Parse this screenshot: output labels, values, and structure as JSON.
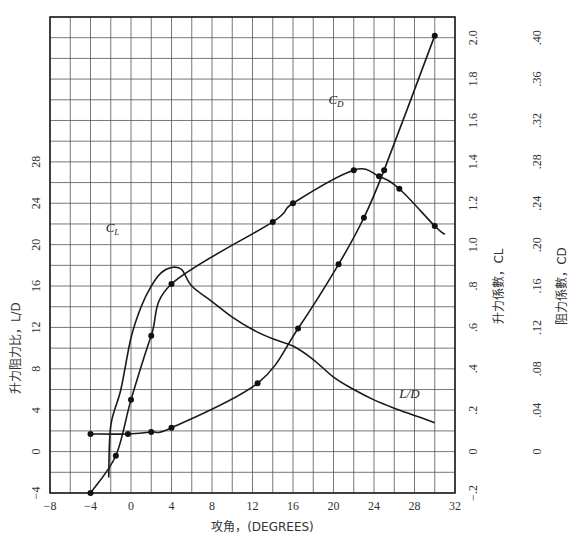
{
  "chart_data": {
    "type": "line",
    "title": "",
    "xlabel": "攻角，(DEGREES)",
    "xlim": [
      -8,
      32
    ],
    "x_ticks": [
      -8,
      -4,
      0,
      4,
      8,
      12,
      16,
      20,
      24,
      28,
      32
    ],
    "grid": true,
    "axes": {
      "left": {
        "label": "升力阻力比，L/D",
        "ticks": [
          -4,
          0,
          4,
          8,
          12,
          16,
          20,
          24,
          28
        ],
        "range": [
          -4,
          42
        ]
      },
      "right1": {
        "label": "升力係數，C_L",
        "ticks": [
          -0.2,
          0,
          0.2,
          0.4,
          0.6,
          0.8,
          1.0,
          1.2,
          1.4,
          1.6,
          1.8,
          2.0
        ],
        "tick_labels": [
          "−.2",
          "0",
          ".2",
          ".4",
          ".6",
          ".8",
          "1.0",
          "1.2",
          "1.4",
          "1.6",
          "1.8",
          "2.0"
        ],
        "range": [
          -0.2,
          2.1
        ]
      },
      "right2": {
        "label": "阻力係數，C_D",
        "ticks": [
          0,
          0.04,
          0.08,
          0.12,
          0.16,
          0.2,
          0.24,
          0.28,
          0.32,
          0.36,
          0.4
        ],
        "tick_labels": [
          "0",
          ".04",
          ".08",
          ".12",
          ".16",
          ".20",
          ".24",
          ".28",
          ".32",
          ".36",
          ".40"
        ],
        "range": [
          -0.04,
          0.42
        ]
      }
    },
    "series": [
      {
        "name": "C_L",
        "axis": "right1",
        "label": "C",
        "label_sub": "L",
        "x": [
          -4,
          -1.5,
          0,
          2,
          4,
          14,
          16,
          22,
          24.5,
          26.5,
          30
        ],
        "values": [
          -0.2,
          -0.02,
          0.25,
          0.56,
          0.81,
          1.11,
          1.2,
          1.36,
          1.33,
          1.27,
          1.09
        ],
        "markers": true
      },
      {
        "name": "C_D",
        "axis": "right2",
        "label": "C",
        "label_sub": "D",
        "x": [
          -4,
          -0.3,
          2,
          4,
          12.5,
          16.5,
          20.5,
          23,
          25,
          30
        ],
        "values": [
          0.017,
          0.017,
          0.019,
          0.023,
          0.066,
          0.119,
          0.181,
          0.226,
          0.272,
          0.402
        ],
        "markers": true
      },
      {
        "name": "L/D",
        "axis": "left",
        "label": "L/D",
        "x": [
          -2.2,
          -2,
          -1,
          0,
          1,
          2,
          3,
          4,
          5,
          6,
          8,
          10,
          12,
          14,
          16,
          18,
          20,
          22,
          24,
          26,
          28,
          30
        ],
        "values": [
          -2.5,
          2.5,
          6,
          11,
          14,
          16,
          17.3,
          17.8,
          17.6,
          16,
          14.5,
          13,
          11.8,
          10.9,
          10.2,
          8.9,
          7.2,
          6,
          5,
          4.2,
          3.5,
          2.8
        ],
        "markers": false
      }
    ]
  }
}
